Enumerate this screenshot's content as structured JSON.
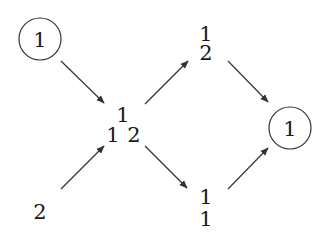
{
  "diagram": {
    "type": "directed-graph",
    "nodes": [
      {
        "id": "top_left",
        "label": "1",
        "circled": true
      },
      {
        "id": "bottom_left",
        "label": "2",
        "circled": false
      },
      {
        "id": "center",
        "label_top": "1",
        "label_left": "1",
        "label_right": "2",
        "circled": false
      },
      {
        "id": "upper_right",
        "label_top": "1",
        "label_bottom": "2",
        "circled": false
      },
      {
        "id": "lower_right",
        "label_top": "1",
        "label_bottom": "1",
        "circled": false
      },
      {
        "id": "right",
        "label": "1",
        "circled": true
      }
    ],
    "edges": [
      {
        "from": "top_left",
        "to": "center"
      },
      {
        "from": "bottom_left",
        "to": "center"
      },
      {
        "from": "center",
        "to": "upper_right"
      },
      {
        "from": "center",
        "to": "lower_right"
      },
      {
        "from": "upper_right",
        "to": "right"
      },
      {
        "from": "lower_right",
        "to": "right"
      }
    ],
    "colors": {
      "stroke": "#333333",
      "text": "#1a1a1a",
      "background": "#ffffff"
    }
  }
}
